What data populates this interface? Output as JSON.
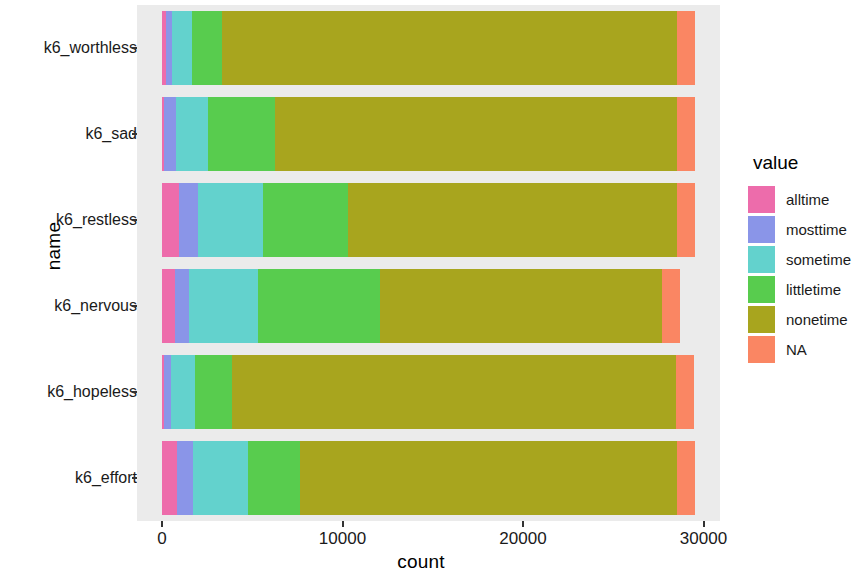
{
  "chart_data": {
    "type": "bar",
    "orientation": "horizontal",
    "stacked": true,
    "title": "",
    "xlabel": "count",
    "ylabel": "name",
    "xlim": [
      0,
      31000
    ],
    "xticks": [
      0,
      10000,
      20000,
      30000
    ],
    "xtick_labels": [
      "0",
      "10000",
      "20000",
      "30000"
    ],
    "grid": false,
    "legend_position": "right",
    "legend_title": "value",
    "categories": [
      "k6_worthless",
      "k6_sad",
      "k6_restless",
      "k6_nervous",
      "k6_hopeless",
      "k6_effort"
    ],
    "series": [
      {
        "name": "alltime",
        "color": "#ed6cab",
        "values": [
          230,
          120,
          940,
          720,
          110,
          830
        ]
      },
      {
        "name": "mosttime",
        "color": "#8a95e8",
        "values": [
          330,
          660,
          1050,
          780,
          390,
          890
        ]
      },
      {
        "name": "sometime",
        "color": "#63d2cd",
        "values": [
          1110,
          1770,
          3600,
          3820,
          1330,
          3050
        ]
      },
      {
        "name": "littletime",
        "color": "#58cc4e",
        "values": [
          1660,
          3710,
          4710,
          6760,
          2050,
          2880
        ]
      },
      {
        "name": "nonetime",
        "color": "#a8a51e",
        "values": [
          25190,
          22260,
          18220,
          15600,
          24620,
          20870
        ]
      },
      {
        "name": "NA",
        "color": "#fa8663",
        "values": [
          997,
          997,
          997,
          997,
          997,
          997
        ]
      }
    ]
  },
  "legend": {
    "title": "value",
    "items": [
      {
        "label": "alltime",
        "color": "#ed6cab"
      },
      {
        "label": "mosttime",
        "color": "#8a95e8"
      },
      {
        "label": "sometime",
        "color": "#63d2cd"
      },
      {
        "label": "littletime",
        "color": "#58cc4e"
      },
      {
        "label": "nonetime",
        "color": "#a8a51e"
      },
      {
        "label": "NA",
        "color": "#fa8663"
      }
    ]
  },
  "axes": {
    "x_title": "count",
    "y_title": "name",
    "x_tick_labels": [
      "0",
      "10000",
      "20000",
      "30000"
    ],
    "y_tick_labels": [
      "k6_worthless",
      "k6_sad",
      "k6_restless",
      "k6_nervous",
      "k6_hopeless",
      "k6_effort"
    ]
  },
  "style": {
    "panel_background": "#ebebeb",
    "page_background": "#ffffff",
    "text_color": "#1a1a1a"
  }
}
